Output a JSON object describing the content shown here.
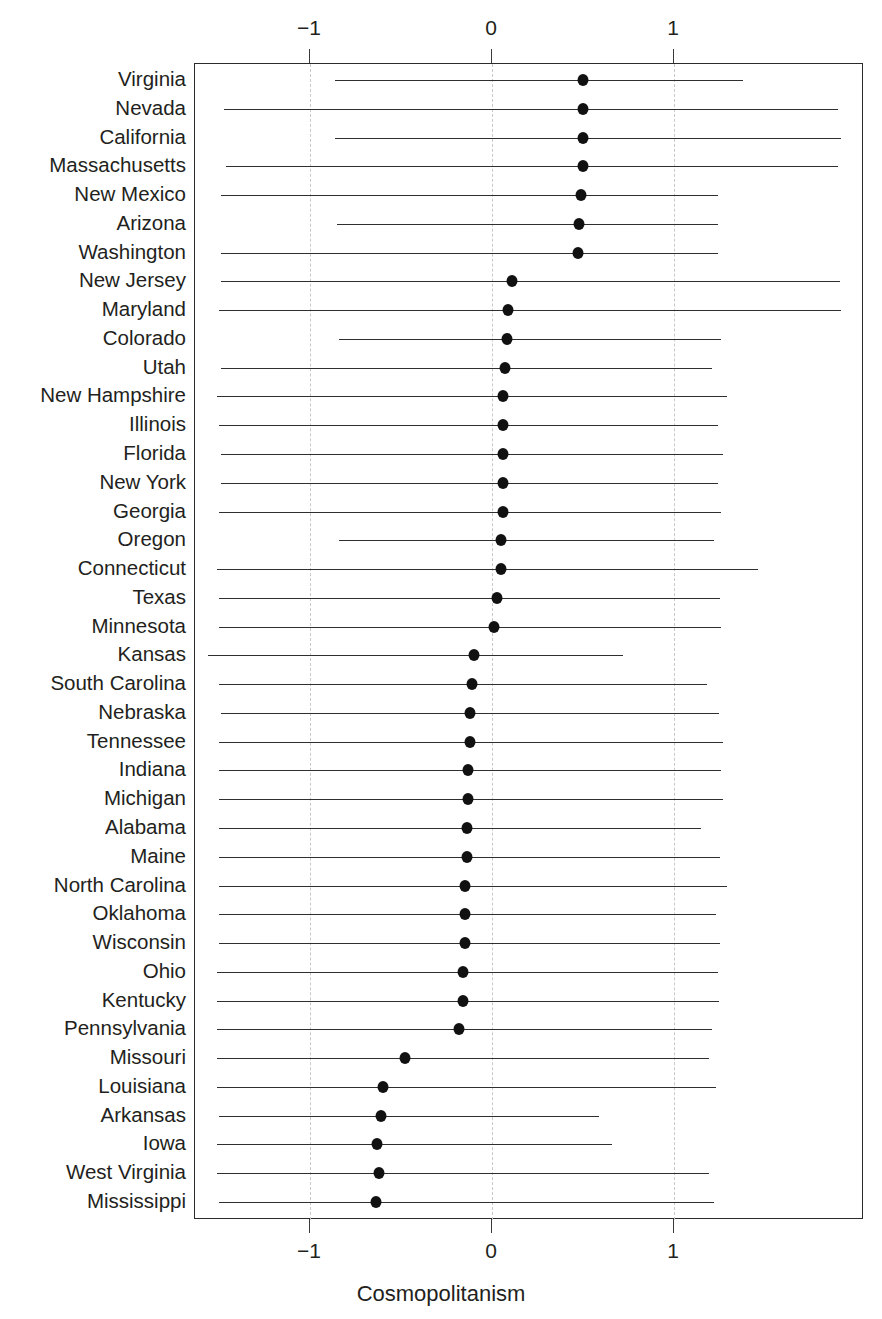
{
  "chart_data": {
    "type": "dot-with-error-bars",
    "title": "",
    "xlabel": "Cosmopolitanism",
    "ylabel": "",
    "xlim": [
      -1.6,
      2.04
    ],
    "xticks": [
      -1,
      0,
      1
    ],
    "xticklabels": [
      "−1",
      "0",
      "1"
    ],
    "grid": "vertical dashed gridlines at each xtick",
    "legend": "none",
    "axis_positions": "top and bottom duplicated x-axes",
    "categories": [
      "Virginia",
      "Nevada",
      "California",
      "Massachusetts",
      "New Mexico",
      "Arizona",
      "Washington",
      "New Jersey",
      "Maryland",
      "Colorado",
      "Utah",
      "New Hampshire",
      "Illinois",
      "Florida",
      "New York",
      "Georgia",
      "Oregon",
      "Connecticut",
      "Texas",
      "Minnesota",
      "Kansas",
      "South Carolina",
      "Nebraska",
      "Tennessee",
      "Indiana",
      "Michigan",
      "Alabama",
      "Maine",
      "North Carolina",
      "Oklahoma",
      "Wisconsin",
      "Ohio",
      "Kentucky",
      "Pennsylvania",
      "Missouri",
      "Louisiana",
      "Arkansas",
      "Iowa",
      "West Virginia",
      "Mississippi"
    ],
    "estimates": [
      0.5,
      0.5,
      0.5,
      0.5,
      0.49,
      0.48,
      0.47,
      0.11,
      0.09,
      0.08,
      0.07,
      0.06,
      0.06,
      0.06,
      0.06,
      0.06,
      0.05,
      0.05,
      0.03,
      0.01,
      -0.1,
      -0.11,
      -0.12,
      -0.12,
      -0.13,
      -0.13,
      -0.14,
      -0.14,
      -0.15,
      -0.15,
      -0.15,
      -0.16,
      -0.16,
      -0.18,
      -0.48,
      -0.6,
      -0.61,
      -0.63,
      -0.62,
      -0.64
    ],
    "ci_lower": [
      -0.86,
      -1.47,
      -0.86,
      -1.46,
      -1.49,
      -0.85,
      -1.49,
      -1.49,
      -1.5,
      -0.84,
      -1.49,
      -1.51,
      -1.5,
      -1.49,
      -1.49,
      -1.5,
      -0.84,
      -1.51,
      -1.5,
      -1.5,
      -1.56,
      -1.5,
      -1.49,
      -1.5,
      -1.5,
      -1.5,
      -1.5,
      -1.5,
      -1.5,
      -1.5,
      -1.5,
      -1.51,
      -1.51,
      -1.51,
      -1.51,
      -1.51,
      -1.5,
      -1.51,
      -1.51,
      -1.5
    ],
    "ci_upper": [
      1.38,
      1.9,
      1.92,
      1.9,
      1.24,
      1.24,
      1.24,
      1.91,
      1.92,
      1.26,
      1.21,
      1.29,
      1.24,
      1.27,
      1.24,
      1.26,
      1.22,
      1.46,
      1.25,
      1.26,
      0.72,
      1.18,
      1.25,
      1.27,
      1.26,
      1.27,
      1.15,
      1.25,
      1.29,
      1.23,
      1.25,
      1.24,
      1.25,
      1.21,
      1.19,
      1.23,
      0.59,
      0.66,
      1.19,
      1.22
    ]
  },
  "axis": {
    "x_title": "Cosmopolitanism"
  }
}
